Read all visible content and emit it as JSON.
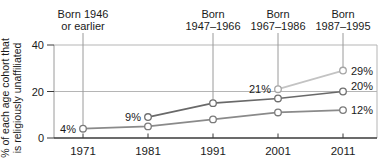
{
  "chart_data": {
    "type": "line",
    "ylabel_lines": [
      "% of each age cohort that",
      "is religiously unaffiliated"
    ],
    "x_ticks": [
      "1971",
      "1981",
      "1991",
      "2001",
      "2011"
    ],
    "y_ticks": [
      0,
      20,
      40
    ],
    "ylim": [
      0,
      40
    ],
    "grid": "horizontal-at-20-and-40",
    "legend": "none",
    "series": [
      {
        "name": "Born 1946 or earlier",
        "x": [
          1971,
          1981,
          1991,
          2001,
          2011
        ],
        "values": [
          4,
          5,
          8,
          11,
          12
        ],
        "color": "#8a8a8a",
        "marker_stroke": "#7a7a7a",
        "point_labels": [
          {
            "x": 1971,
            "text": "4%",
            "side": "left",
            "dy_offset": 4
          },
          {
            "x": 2011,
            "text": "12%",
            "side": "right",
            "dy_offset": 4
          }
        ]
      },
      {
        "name": "Born 1947–1966",
        "x": [
          1981,
          1991,
          2001,
          2011
        ],
        "values": [
          9,
          15,
          17,
          20
        ],
        "color": "#696969",
        "marker_stroke": "#6f6f6f",
        "point_labels": [
          {
            "x": 1981,
            "text": "9%",
            "side": "left",
            "dy_offset": 4
          },
          {
            "x": 2011,
            "text": "20%",
            "side": "right",
            "dy_offset": -2
          }
        ]
      },
      {
        "name": "Born 1967–1986",
        "x": [
          2001,
          2011
        ],
        "values": [
          21,
          29
        ],
        "color": "#c3c3c3",
        "marker_stroke": "#a5a5a5",
        "point_labels": [
          {
            "x": 2001,
            "text": "21%",
            "side": "left",
            "dy_offset": 4
          },
          {
            "x": 2011,
            "text": "29%",
            "side": "right",
            "dy_offset": 4
          }
        ]
      }
    ],
    "cohort_annotations": [
      {
        "label_lines": [
          "Born 1946",
          "or earlier"
        ],
        "year": 1971,
        "points_to_value": 4
      },
      {
        "label_lines": [
          "Born",
          "1947–1966"
        ],
        "year": 1991,
        "points_to_value": 15
      },
      {
        "label_lines": [
          "Born",
          "1967–1986"
        ],
        "year": 2001,
        "points_to_value": 21
      },
      {
        "label_lines": [
          "Born",
          "1987–1995"
        ],
        "year": 2011,
        "points_to_value": 29
      }
    ],
    "colors": {
      "axis": "#3a3a3a",
      "grid": "#b5b5b5",
      "plot_border": "#9a9a9a",
      "dropline": "#9a9a9a",
      "text": "#1a1a1a",
      "marker_fill": "#ffffff"
    }
  }
}
